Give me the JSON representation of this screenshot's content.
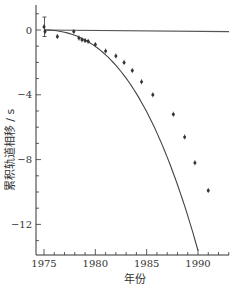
{
  "chart_data": {
    "type": "line",
    "title": "",
    "xlabel": "年份",
    "ylabel": "累积轨道相移 / s",
    "xlim": [
      1974.5,
      1993
    ],
    "ylim": [
      -14,
      1.8
    ],
    "x_ticks": [
      1975,
      1980,
      1985,
      1990
    ],
    "y_ticks": [
      0,
      -4,
      -8,
      -12
    ],
    "x_tick_labels": [
      "1975",
      "1980",
      "1985",
      "1990"
    ],
    "y_tick_labels": [
      "0",
      "−4",
      "−8",
      "−12"
    ],
    "grid": false,
    "legend": null,
    "series": [
      {
        "name": "observed",
        "kind": "scatter-with-errorbars",
        "x": [
          1975.0,
          1975.1,
          1976.3,
          1977.9,
          1978.4,
          1978.7,
          1979.0,
          1979.3,
          1980.0,
          1981.0,
          1982.0,
          1982.8,
          1983.6,
          1984.5,
          1985.6,
          1987.6,
          1988.7,
          1989.7,
          1991.0
        ],
        "y": [
          0.2,
          -0.1,
          -0.4,
          -0.1,
          -0.5,
          -0.6,
          -0.65,
          -0.7,
          -0.9,
          -1.3,
          -1.6,
          -2.0,
          -2.5,
          -3.2,
          -4.0,
          -5.2,
          -6.6,
          -8.2,
          -9.9
        ]
      },
      {
        "name": "GR prediction",
        "kind": "curve",
        "x": [
          1975,
          1977,
          1979,
          1981,
          1983,
          1985,
          1987,
          1989,
          1991,
          1993
        ],
        "y": [
          0,
          -0.18,
          -0.6,
          -1.2,
          -2.1,
          -3.3,
          -4.9,
          -7.0,
          -9.8,
          -14.0
        ]
      },
      {
        "name": "no-decay reference",
        "kind": "line",
        "x": [
          1975,
          1993
        ],
        "y": [
          0,
          -0.1
        ]
      }
    ]
  }
}
